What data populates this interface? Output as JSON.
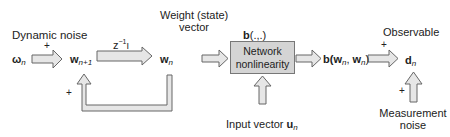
{
  "diagram": {
    "labels": {
      "dynamic_noise": "Dynamic noise",
      "weight_vector_line1": "Weight (state)",
      "weight_vector_line2": "vector",
      "observable": "Observable",
      "measurement_noise_line1": "Measurement",
      "measurement_noise_line2": "noise",
      "input_vector": "Input vector"
    },
    "symbols": {
      "omega": "ω",
      "omega_sub": "n",
      "w_next": "w",
      "w_next_sub": "n+1",
      "delay": "z",
      "delay_sup": "−1",
      "delay_suffix": "I",
      "w_n": "w",
      "w_n_sub": "n",
      "b_func": "b",
      "b_func_args": "(.,.)",
      "b_out_prefix": "b(",
      "b_out_w1": "w",
      "b_out_w1_sub": "n",
      "b_out_sep": ", ",
      "b_out_w2": "w",
      "b_out_w2_sub": "n",
      "b_out_suffix": ")",
      "d_n": "d",
      "d_n_sub": "n",
      "u_n": "u",
      "u_n_sub": "n"
    },
    "block": {
      "line1": "Network",
      "line2": "nonlinearity"
    },
    "signs": {
      "plus": "+"
    },
    "colors": {
      "arrow_fill": "#e6e6e6",
      "arrow_stroke": "#666666",
      "block_fill": "#d4d4d4",
      "block_border": "#777777"
    }
  }
}
